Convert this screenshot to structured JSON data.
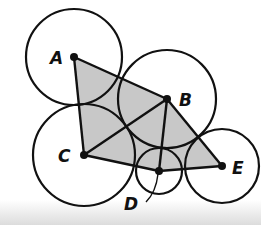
{
  "diagram": {
    "type": "geometry-figure",
    "points": [
      {
        "id": "A",
        "label": "A",
        "x": 74,
        "y": 57,
        "r": 48,
        "label_x": 50,
        "label_y": 64
      },
      {
        "id": "B",
        "label": "B",
        "x": 167,
        "y": 99,
        "r": 49,
        "label_x": 179,
        "label_y": 106
      },
      {
        "id": "C",
        "label": "C",
        "x": 84,
        "y": 155,
        "r": 51,
        "label_x": 58,
        "label_y": 162
      },
      {
        "id": "D",
        "label": "D",
        "x": 159,
        "y": 171,
        "r": 23,
        "label_x": 124,
        "label_y": 210
      },
      {
        "id": "E",
        "label": "E",
        "x": 222,
        "y": 166,
        "r": 37,
        "label_x": 232,
        "label_y": 174
      }
    ],
    "segments": [
      [
        "A",
        "B"
      ],
      [
        "A",
        "C"
      ],
      [
        "C",
        "D"
      ],
      [
        "D",
        "E"
      ],
      [
        "B",
        "E"
      ],
      [
        "C",
        "B"
      ],
      [
        "B",
        "D"
      ]
    ],
    "shaded_polygon": [
      "A",
      "B",
      "E",
      "D",
      "C"
    ],
    "colors": {
      "stroke": "#111111",
      "fill": "#c8c8c8",
      "background": "#ffffff"
    }
  }
}
